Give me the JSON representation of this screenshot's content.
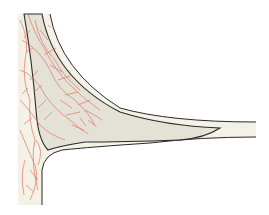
{
  "illustration": {
    "subject": "anatomical-cross-section",
    "colors": {
      "background": "#ffffff",
      "tissue_fill": "#f4f1e6",
      "inner_fill": "#e4e2d6",
      "outline": "#2a2a2a",
      "vessel": "#e0634f"
    }
  }
}
